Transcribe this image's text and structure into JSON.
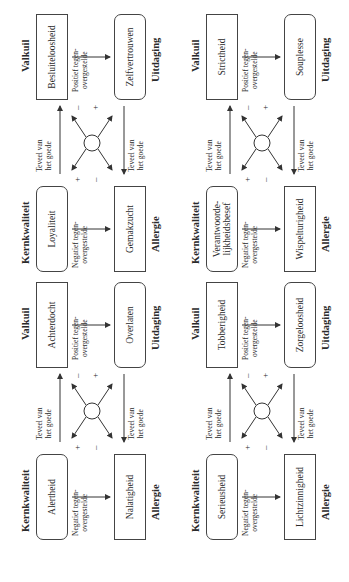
{
  "diagram": {
    "labels": {
      "core_quality": "Kernkwaliteit",
      "pitfall": "Valkuil",
      "challenge": "Uitdaging",
      "allergy": "Allergie",
      "too_much_line1": "Teveel van",
      "too_much_line2": "het goede",
      "positive_line1": "Positief tegen-",
      "positive_line2": "overgestelde",
      "negative_line1": "Negatief tegen-",
      "negative_line2": "overgestelde",
      "plus": "+",
      "minus": "–"
    },
    "quadrants": [
      {
        "position": "top-left",
        "core_quality": "Loyaliteit",
        "pitfall": "Besluiteloosheid",
        "challenge": "Zelfvertrouwen",
        "allergy": "Gemakzucht"
      },
      {
        "position": "top-right",
        "core_quality_line1": "Verantwoorde-",
        "core_quality_line2": "lijkheidsbesef",
        "pitfall": "Strictheid",
        "challenge": "Souplesse",
        "allergy": "Wispelturigheid"
      },
      {
        "position": "bottom-left",
        "core_quality": "Alertheid",
        "pitfall": "Achterdocht",
        "challenge": "Overlaten",
        "allergy": "Nalatigheid"
      },
      {
        "position": "bottom-right",
        "core_quality": "Serieusheid",
        "pitfall": "Tobberigheid",
        "challenge": "Zorgeloosheid",
        "allergy": "Lichtzinnigheid"
      }
    ]
  }
}
